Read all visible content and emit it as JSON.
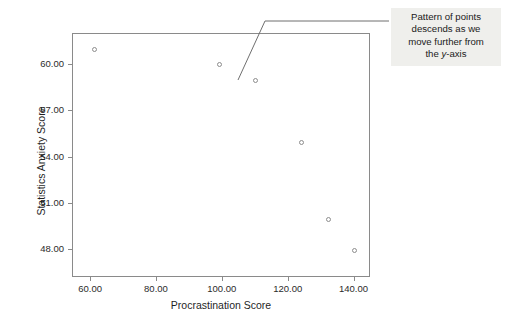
{
  "chart_data": {
    "type": "scatter",
    "title": "",
    "xlabel": "Procrastination Score",
    "ylabel": "Statistics Anxiety Score",
    "xlim": [
      54.5,
      145.0
    ],
    "ylim": [
      46.2,
      62.0
    ],
    "xticks": [
      60,
      80,
      100,
      120,
      140
    ],
    "xtick_labels": [
      "60.00",
      "80.00",
      "100.00",
      "120.00",
      "140.00"
    ],
    "yticks": [
      48,
      51,
      54,
      57,
      60
    ],
    "ytick_labels": [
      "48.00",
      "51.00",
      "54.00",
      "57.00",
      "60.00"
    ],
    "grid": false,
    "legend": null,
    "marker": "open-circle",
    "marker_color": "#8d8d8d",
    "points": [
      {
        "x": 61,
        "y": 61.0
      },
      {
        "x": 99,
        "y": 60.0
      },
      {
        "x": 110,
        "y": 59.0
      },
      {
        "x": 124,
        "y": 55.0
      },
      {
        "x": 132,
        "y": 50.0
      },
      {
        "x": 140,
        "y": 48.0
      }
    ],
    "annotations": [
      {
        "text_line_1": "Pattern of points",
        "text_line_2": "descends as we",
        "text_line_3": "move further from",
        "text_line_4_prefix": "the ",
        "text_line_4_em": "y",
        "text_line_4_suffix": "-axis",
        "background": "#efefec"
      }
    ]
  },
  "style": {
    "frame_color": "#8a8a8a",
    "text_color": "#262626",
    "background": "#ffffff"
  }
}
